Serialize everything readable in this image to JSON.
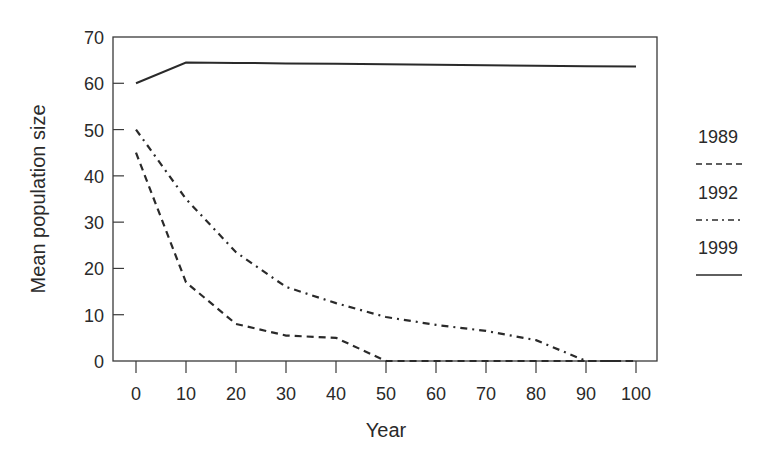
{
  "chart_data": {
    "type": "line",
    "title": "",
    "xlabel": "Year",
    "ylabel": "Mean population size",
    "xlim": [
      0,
      100
    ],
    "ylim": [
      0,
      70
    ],
    "x_ticks": [
      0,
      10,
      20,
      30,
      40,
      50,
      60,
      70,
      80,
      90,
      100
    ],
    "y_ticks": [
      0,
      10,
      20,
      30,
      40,
      50,
      60,
      70
    ],
    "grid": false,
    "legend_position": "right",
    "x": [
      0,
      10,
      20,
      30,
      40,
      50,
      60,
      70,
      80,
      90,
      100
    ],
    "series": [
      {
        "name": "1989",
        "style": "dashed",
        "values": [
          45,
          17,
          8,
          5.5,
          5,
          0,
          0,
          0,
          0,
          0,
          0
        ]
      },
      {
        "name": "1992",
        "style": "dash-dot",
        "values": [
          50,
          35,
          23.5,
          16,
          12.5,
          9.5,
          7.8,
          6.5,
          4.5,
          0,
          0
        ]
      },
      {
        "name": "1999",
        "style": "solid",
        "values": [
          60,
          64.5,
          64.4,
          64.3,
          64.2,
          64.1,
          64,
          63.9,
          63.8,
          63.7,
          63.6
        ]
      }
    ],
    "line_color": "#2a2a2a"
  }
}
